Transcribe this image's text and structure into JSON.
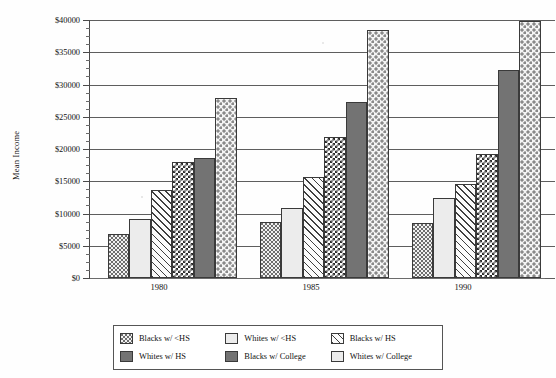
{
  "chart_data": {
    "type": "bar",
    "title": "",
    "xlabel": "",
    "ylabel": "Mean Income",
    "categories": [
      "1980",
      "1985",
      "1990"
    ],
    "ylim": [
      0,
      40000
    ],
    "ytick_values": [
      0,
      5000,
      10000,
      15000,
      20000,
      25000,
      30000,
      35000,
      40000
    ],
    "ytick_labels": [
      "$0",
      "$5000",
      "$10000",
      "$15000",
      "$20000",
      "$25000",
      "$30000",
      "$35000",
      "$40000"
    ],
    "ytick_minor_step": 1250,
    "grid": true,
    "legend_position": "bottom",
    "series": [
      {
        "name": "Blacks w/ <HS",
        "pattern": "light-dots",
        "values": [
          6800,
          8700,
          8500
        ]
      },
      {
        "name": "Whites w/ <HS",
        "pattern": "solid-light",
        "values": [
          9100,
          10900,
          12400
        ]
      },
      {
        "name": "Blacks w/ HS",
        "pattern": "diagonal",
        "values": [
          13700,
          15600,
          14600
        ]
      },
      {
        "name": "Whites w/ HS",
        "pattern": "checkerboard",
        "values": [
          18000,
          21900,
          19300
        ]
      },
      {
        "name": "Blacks w/ College",
        "pattern": "dark-gray",
        "values": [
          18600,
          27300,
          32200
        ]
      },
      {
        "name": "Whites w/ College",
        "pattern": "coarse-dots",
        "values": [
          27900,
          38500,
          39800
        ]
      }
    ]
  },
  "colors": {
    "axis": "#4a4a4a",
    "gridline": "#5e5e5e",
    "bar_outline": "#3a3a3a",
    "dark_gray_fill": "#737373",
    "light_fill": "#ececec",
    "background": "#ffffff"
  }
}
